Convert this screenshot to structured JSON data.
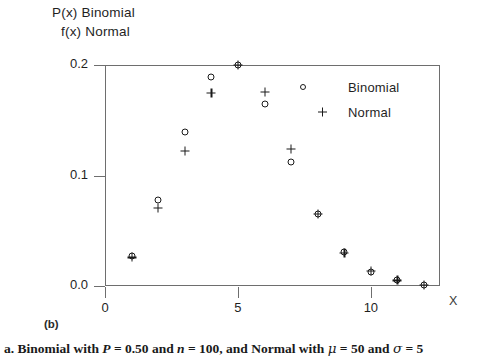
{
  "figure": {
    "panel_letter": "(b)",
    "caption_prefix": "a.",
    "caption_text": "a. Binomial with P = 0.50 and n = 100, and Normal with μ = 50 and σ = 5",
    "caption_parts": {
      "lead": "a. Binomial with",
      "p_symbol": "P",
      "p_value": "= 0.50 and",
      "n_symbol": "n",
      "n_value": "= 100, and Normal with",
      "mu_symbol": "μ",
      "mu_value": "= 50 and",
      "sigma_symbol": "σ",
      "sigma_value": "= 5"
    }
  },
  "axes": {
    "ylabel_line1": "P(x)  Binomial",
    "ylabel_line2": "f(x) Normal",
    "xaxis_name": "X"
  },
  "legend": {
    "position": "inside-top-right",
    "entries": [
      {
        "symbol": "open-circle",
        "label": "Binomial"
      },
      {
        "symbol": "plus",
        "label": "Normal"
      }
    ]
  },
  "chart_data": {
    "type": "scatter",
    "title": "",
    "subtitle": "",
    "xlabel": "X",
    "ylabel": "P(x) Binomial / f(x) Normal",
    "xlim": [
      0,
      12.6
    ],
    "ylim": [
      0.0,
      0.2
    ],
    "grid": false,
    "legend_position": "inside-top-right",
    "xticks": [
      0,
      5,
      10
    ],
    "xtick_labels": [
      "0",
      "5",
      "10"
    ],
    "yticks": [
      0.0,
      0.1,
      0.2
    ],
    "ytick_labels": [
      "0.0",
      "0.1",
      "0.2"
    ],
    "x": [
      1,
      2,
      3,
      4,
      5,
      6,
      7,
      8,
      9,
      10,
      11,
      12
    ],
    "series": [
      {
        "name": "Binomial",
        "marker": "open-circle",
        "values": [
          0.027,
          0.078,
          0.139,
          0.189,
          0.2,
          0.165,
          0.112,
          0.065,
          0.031,
          0.013,
          0.005,
          0.001
        ]
      },
      {
        "name": "Normal",
        "marker": "plus",
        "values": [
          0.026,
          0.071,
          0.122,
          0.175,
          0.2,
          0.176,
          0.124,
          0.065,
          0.03,
          0.014,
          0.005,
          0.001
        ]
      }
    ],
    "annotations": [
      "(b)"
    ]
  }
}
